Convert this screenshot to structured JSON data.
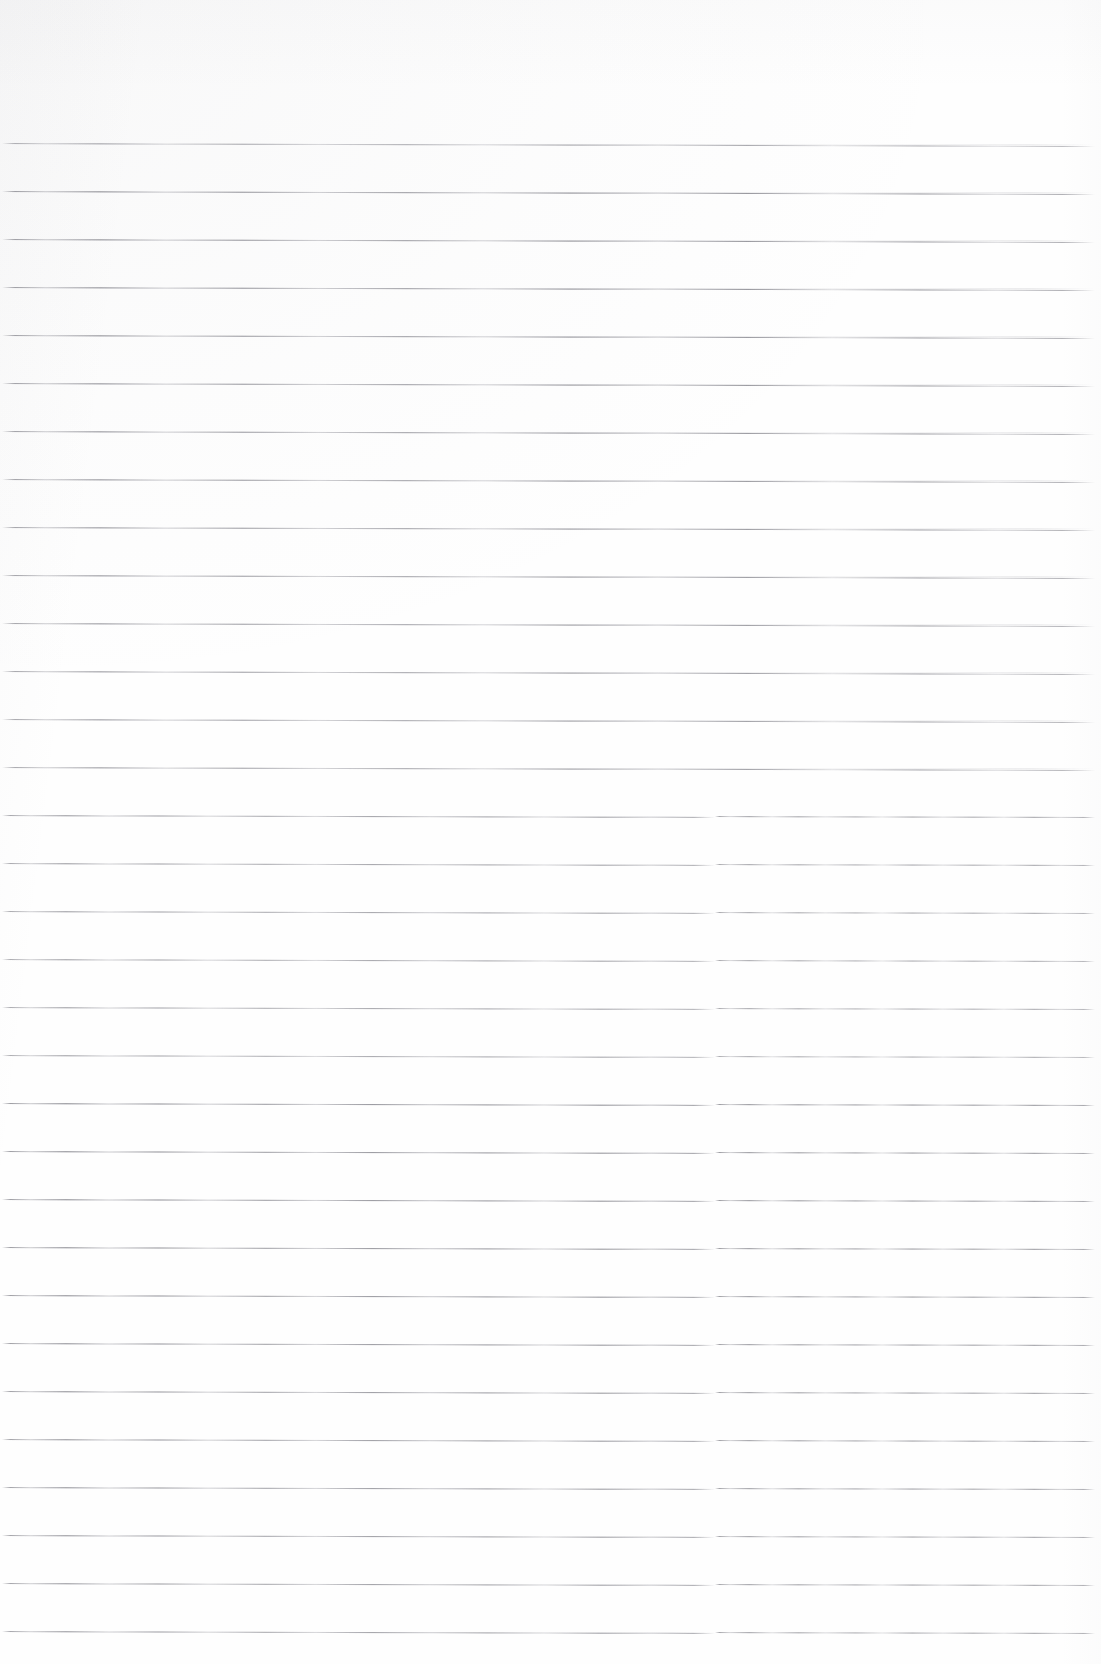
{
  "document": {
    "kind": "scanned-page",
    "title": "Blank Ruled Notebook Page",
    "page_text": "",
    "handwriting": "",
    "annotations": [],
    "typed_text": [],
    "headers": [],
    "footers": [],
    "page_number": "",
    "margin_notes": []
  },
  "page": {
    "width_px": 1101,
    "height_px": 1664,
    "background_color": "#fefefe",
    "paper_tint_color": "#f7f7f8",
    "is_blank": true
  },
  "ruling": {
    "style": "horizontal-ruled",
    "line_color": "#9a9a9f",
    "line_thickness_px": 1,
    "line_count": 32,
    "first_line_y": 144,
    "spacing_px": 48,
    "left_inset_px": 2,
    "right_inset_px": 6,
    "top_margin_px": 143,
    "bottom_margin_px": 32,
    "has_vertical_margin_rule": false,
    "slope_px_over_width": 3,
    "step_artifact_x": 715,
    "step_artifact_offset_px": 1,
    "line_y_positions": [
      144,
      192,
      240,
      288,
      336,
      384,
      432,
      480,
      528,
      576,
      624,
      672,
      720,
      768,
      816,
      864,
      912,
      960,
      1008,
      1056,
      1104,
      1152,
      1200,
      1248,
      1296,
      1344,
      1392,
      1440,
      1488,
      1536,
      1584,
      1632
    ]
  }
}
